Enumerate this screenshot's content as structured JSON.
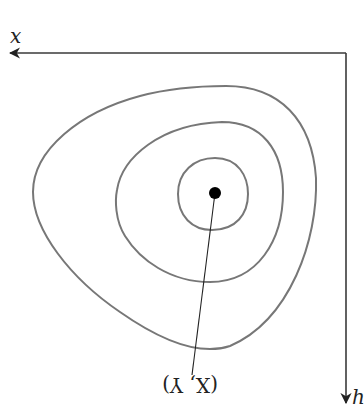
{
  "diagram": {
    "title": "",
    "axes": {
      "horizontal": {
        "label": "x",
        "direction": "left"
      },
      "vertical": {
        "label": "h",
        "direction": "down"
      }
    },
    "contours": [
      {
        "name": "outer",
        "count_index": 1
      },
      {
        "name": "middle",
        "count_index": 2
      },
      {
        "name": "inner",
        "count_index": 3
      }
    ],
    "center_point": {
      "label": "(X, Y)",
      "label_orientation": "rotated 180°"
    },
    "colors": {
      "axis": "#3a3a3a",
      "contour": "#777777",
      "point": "#000000",
      "background": "#ffffff"
    }
  }
}
